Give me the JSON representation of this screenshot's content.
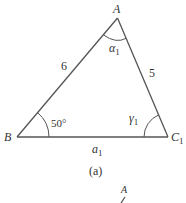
{
  "figure": {
    "caption": "(a)",
    "stroke_color": "#555555",
    "text_color": "#333333",
    "vertices": {
      "A": {
        "label": "A",
        "x": 117.5,
        "y": 18
      },
      "B": {
        "label": "B",
        "x": 17,
        "y": 137
      },
      "C1": {
        "label": "C",
        "subscript": "1",
        "x": 168,
        "y": 137
      }
    },
    "sides": {
      "AB": {
        "label": "6"
      },
      "AC1": {
        "label": "5"
      },
      "BC1": {
        "label": "a",
        "subscript": "1"
      }
    },
    "angles": {
      "A": {
        "label": "α",
        "subscript": "1"
      },
      "B": {
        "label": "50°"
      },
      "C1": {
        "label": "γ",
        "subscript": "1"
      }
    },
    "next_figure_partial": {
      "vertex_label": "A"
    }
  }
}
